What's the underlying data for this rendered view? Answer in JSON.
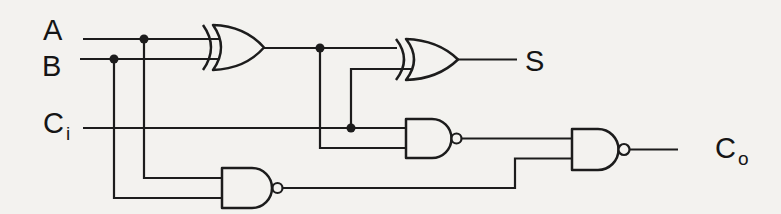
{
  "diagram": {
    "type": "logic-circuit",
    "inputs": [
      "A",
      "B",
      "Ci"
    ],
    "outputs": [
      "S",
      "Co"
    ],
    "gates": [
      {
        "id": "xor1",
        "type": "XOR",
        "inputs": [
          "A",
          "B"
        ]
      },
      {
        "id": "xor2",
        "type": "XOR",
        "inputs": [
          "xor1-output",
          "Ci"
        ],
        "output": "S"
      },
      {
        "id": "nand1",
        "type": "NAND",
        "inputs": [
          "Ci",
          "xor1-output"
        ]
      },
      {
        "id": "nand2",
        "type": "NAND",
        "inputs": [
          "A",
          "B"
        ]
      },
      {
        "id": "nand3",
        "type": "NAND",
        "inputs": [
          "nand1-output",
          "nand2-output"
        ],
        "output": "Co"
      }
    ]
  },
  "labels": {
    "a": "A",
    "b": "B",
    "ci": {
      "base": "C",
      "sub": "i"
    },
    "s": "S",
    "co": {
      "base": "C",
      "sub": "o"
    }
  },
  "colors": {
    "line": "#1c1c1c",
    "background": "#f3f2ef"
  }
}
